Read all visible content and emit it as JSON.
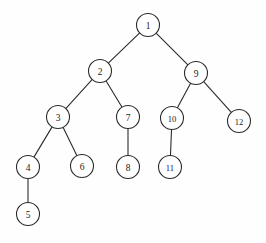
{
  "diagram": {
    "type": "binary-tree",
    "node_radius": 11.5,
    "colors": {
      "background": "#fefefe",
      "stroke": "#2b2b2b",
      "node_fill": "#ffffff",
      "label": "#1a1a1a"
    },
    "nodes": [
      {
        "id": "n1",
        "label": "1",
        "x": 148,
        "y": 25
      },
      {
        "id": "n2",
        "label": "2",
        "x": 100,
        "y": 71
      },
      {
        "id": "n9",
        "label": "9",
        "x": 196,
        "y": 73
      },
      {
        "id": "n3",
        "label": "3",
        "x": 58,
        "y": 117
      },
      {
        "id": "n7",
        "label": "7",
        "x": 128,
        "y": 117
      },
      {
        "id": "n10",
        "label": "10",
        "x": 172,
        "y": 118
      },
      {
        "id": "n12",
        "label": "12",
        "x": 239,
        "y": 121
      },
      {
        "id": "n4",
        "label": "4",
        "x": 28,
        "y": 167
      },
      {
        "id": "n6",
        "label": "6",
        "x": 82,
        "y": 166
      },
      {
        "id": "n8",
        "label": "8",
        "x": 128,
        "y": 167
      },
      {
        "id": "n11",
        "label": "11",
        "x": 170,
        "y": 167
      },
      {
        "id": "n5",
        "label": "5",
        "x": 28,
        "y": 214
      }
    ],
    "edges": [
      {
        "from": "n1",
        "to": "n2"
      },
      {
        "from": "n1",
        "to": "n9"
      },
      {
        "from": "n2",
        "to": "n3"
      },
      {
        "from": "n2",
        "to": "n7"
      },
      {
        "from": "n9",
        "to": "n10"
      },
      {
        "from": "n9",
        "to": "n12"
      },
      {
        "from": "n3",
        "to": "n4"
      },
      {
        "from": "n3",
        "to": "n6"
      },
      {
        "from": "n7",
        "to": "n8"
      },
      {
        "from": "n10",
        "to": "n11"
      },
      {
        "from": "n4",
        "to": "n5"
      }
    ]
  }
}
